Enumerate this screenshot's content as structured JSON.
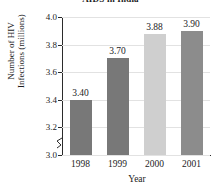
{
  "chart_data": {
    "type": "bar",
    "title": "AIDS in India",
    "xlabel": "Year",
    "ylabel_lines": [
      "Number of HIV",
      "Infections (millions)"
    ],
    "ylabel": "Number of HIV Infections (millions)",
    "categories": [
      "1998",
      "1999",
      "2000",
      "2001"
    ],
    "values": [
      3.4,
      3.7,
      3.88,
      3.9
    ],
    "value_labels": [
      "3.40",
      "3.70",
      "3.88",
      "3.90"
    ],
    "ylim": [
      3.0,
      4.0
    ],
    "y_axis_broken": true,
    "yticks": [
      3.0,
      3.2,
      3.4,
      3.6,
      3.8,
      4.0
    ],
    "ytick_labels": [
      "3.0",
      "3.2",
      "3.4",
      "3.6",
      "3.8",
      "4.0"
    ],
    "grid": true,
    "legend": null,
    "bar_colors": [
      "#787878",
      "#787878",
      "#cfcfcf",
      "#8c8c8c"
    ],
    "axis_color": "#2b2b2b",
    "gridline_color": "#e2e2e2",
    "background_color": "#ffffff"
  }
}
